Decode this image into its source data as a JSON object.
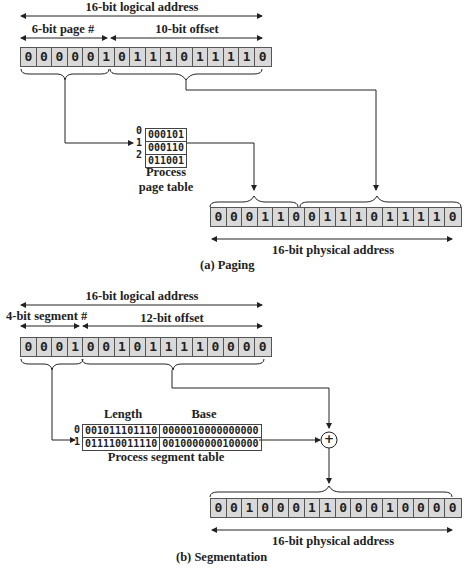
{
  "paging": {
    "logical_label": "16-bit logical address",
    "page_label": "6-bit page #",
    "offset_label": "10-bit offset",
    "logical_bits": [
      "0",
      "0",
      "0",
      "0",
      "0",
      "1",
      "0",
      "1",
      "1",
      "1",
      "0",
      "1",
      "1",
      "1",
      "1",
      "0"
    ],
    "page_table": {
      "indices": [
        "0",
        "1",
        "2"
      ],
      "entries": [
        "000101",
        "000110",
        "011001"
      ],
      "caption_line1": "Process",
      "caption_line2": "page table"
    },
    "physical_bits": [
      "0",
      "0",
      "0",
      "1",
      "1",
      "0",
      "0",
      "1",
      "1",
      "1",
      "0",
      "1",
      "1",
      "1",
      "1",
      "0"
    ],
    "physical_label": "16-bit physical address",
    "caption": "(a) Paging"
  },
  "segmentation": {
    "logical_label": "16-bit logical address",
    "segment_label": "4-bit segment #",
    "offset_label": "12-bit offset",
    "logical_bits": [
      "0",
      "0",
      "0",
      "1",
      "0",
      "0",
      "1",
      "0",
      "1",
      "1",
      "1",
      "1",
      "0",
      "0",
      "0",
      "0"
    ],
    "segment_table": {
      "length_header": "Length",
      "base_header": "Base",
      "indices": [
        "0",
        "1"
      ],
      "rows": [
        {
          "length": "001011101110",
          "base": "0000010000000000"
        },
        {
          "length": "011110011110",
          "base": "0010000000100000"
        }
      ],
      "caption": "Process segment table"
    },
    "adder_symbol": "+",
    "physical_bits": [
      "0",
      "0",
      "1",
      "0",
      "0",
      "0",
      "1",
      "1",
      "0",
      "0",
      "0",
      "1",
      "0",
      "0",
      "0",
      "0"
    ],
    "physical_label": "16-bit physical address",
    "caption": "(b) Segmentation"
  }
}
